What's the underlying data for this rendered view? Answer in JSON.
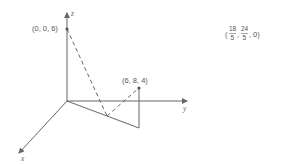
{
  "diagram": {
    "axes": {
      "x_label": "x",
      "y_label": "y",
      "z_label": "z"
    },
    "points": [
      {
        "id": "top",
        "label": "(0, 0, 6)"
      },
      {
        "id": "target",
        "label": "(6, 8, 4)"
      }
    ],
    "projection_point": {
      "open": "(",
      "x_num": "18",
      "x_den": "5",
      "sep1": ",",
      "y_num": "24",
      "y_den": "5",
      "sep2": ",",
      "z": "0)",
      "full": "(18/5, 24/5, 0)"
    },
    "colors": {
      "line": "#666666",
      "text": "#555555"
    }
  }
}
